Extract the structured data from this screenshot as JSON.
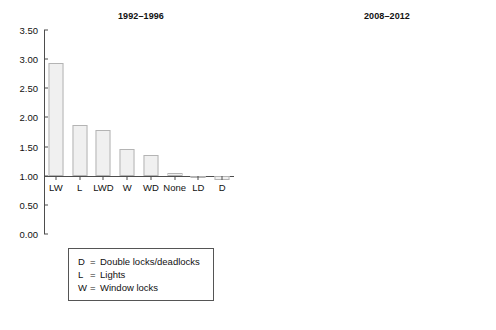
{
  "figure": {
    "background": "#ffffff",
    "bar_fill": "#f0f0f0",
    "bar_stroke": "#b4b4b4",
    "axis_color": "#4d4d4d"
  },
  "panels": [
    {
      "id": "left",
      "title": "1992–1996",
      "legend": [
        {
          "key": "D",
          "eq": "=",
          "text": "Double locks/deadlocks"
        },
        {
          "key": "L",
          "eq": "=",
          "text": "Lights"
        },
        {
          "key": "W",
          "eq": "=",
          "text": "Window locks"
        }
      ]
    },
    {
      "id": "right",
      "title": "2008–2012",
      "legend": [
        {
          "key": "D",
          "eq": "=",
          "text": "Double locks/deadlocks"
        },
        {
          "key": "E",
          "eq": "=",
          "text": "External lights on a sensor"
        },
        {
          "key": "I",
          "eq": "=",
          "text": "Internal lights on a timer"
        },
        {
          "key": "W",
          "eq": "=",
          "text": "Window locks"
        }
      ]
    }
  ],
  "chart_data": [
    {
      "type": "bar",
      "title": "1992–1996",
      "xlabel": "",
      "ylabel": "",
      "ylim": [
        0.0,
        3.5
      ],
      "yticks": [
        "0.00",
        "0.50",
        "1.00",
        "1.50",
        "2.00",
        "2.50",
        "3.00",
        "3.50"
      ],
      "ytick_values": [
        0.0,
        0.5,
        1.0,
        1.5,
        2.0,
        2.5,
        3.0,
        3.5
      ],
      "baseline": 1.0,
      "grid": false,
      "legend_position": "below-plot",
      "categories": [
        "LW",
        "L",
        "LWD",
        "W",
        "WD",
        "None",
        "LD",
        "D"
      ],
      "values": [
        2.93,
        1.87,
        1.79,
        1.45,
        1.36,
        1.05,
        0.97,
        0.93
      ]
    },
    {
      "type": "bar",
      "title": "2008–2012",
      "xlabel": "",
      "ylabel": "",
      "ylim": [
        0.0,
        1.2
      ],
      "yticks": [
        "0.00",
        "0.20",
        "0.40",
        "0.60",
        "0.80",
        "1.00",
        "1.20"
      ],
      "ytick_values": [
        0.0,
        0.2,
        0.4,
        0.6,
        0.8,
        1.0,
        1.2
      ],
      "baseline": 1.0,
      "grid": false,
      "legend_position": "below-plot",
      "categories": [
        "IWD",
        "None",
        "W",
        "WD",
        "D",
        "WIDE",
        "EW",
        "EWD"
      ],
      "values": [
        1.1,
        0.9,
        0.71,
        0.71,
        0.7,
        0.6,
        0.57,
        0.48
      ]
    }
  ]
}
